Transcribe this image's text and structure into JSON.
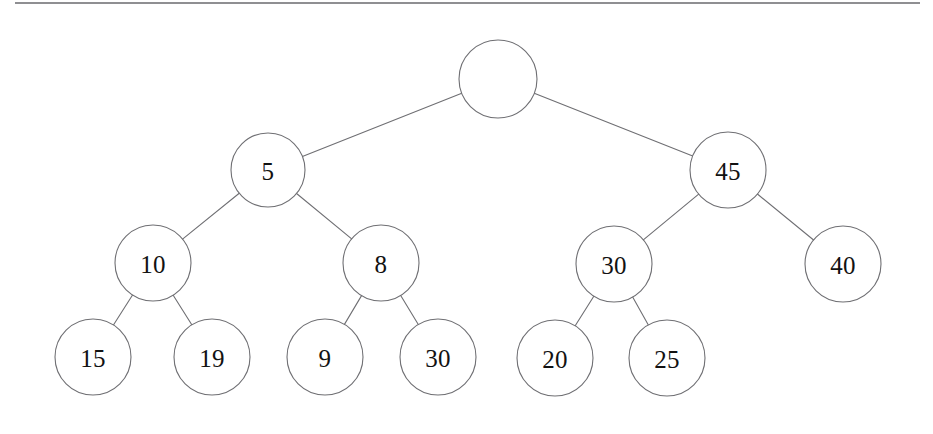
{
  "figure": {
    "canvas": {
      "width": 933,
      "height": 434
    },
    "background_color": "#ffffff",
    "stroke_color": "#6f6f73",
    "text_color": "#121212"
  },
  "top_rule": {
    "name": "top-border-rule",
    "x1": 15,
    "x2": 920,
    "y": 3,
    "color": "#6a6a6e"
  },
  "chart_data": {
    "type": "diagram",
    "subtype": "binary-tree",
    "node_radius": 38,
    "nodes": [
      {
        "id": "root",
        "label": "",
        "cx": 498,
        "cy": 79,
        "r": 39,
        "level": 0
      },
      {
        "id": "n5",
        "label": "5",
        "cx": 268,
        "cy": 170,
        "r": 37,
        "level": 1
      },
      {
        "id": "n45",
        "label": "45",
        "cx": 728,
        "cy": 170,
        "r": 38,
        "level": 1
      },
      {
        "id": "n10",
        "label": "10",
        "cx": 153,
        "cy": 263,
        "r": 38,
        "level": 2
      },
      {
        "id": "n8",
        "label": "8",
        "cx": 381,
        "cy": 263,
        "r": 38,
        "level": 2
      },
      {
        "id": "n30a",
        "label": "30",
        "cx": 614,
        "cy": 264,
        "r": 38,
        "level": 2
      },
      {
        "id": "n40",
        "label": "40",
        "cx": 843,
        "cy": 264,
        "r": 38,
        "level": 2
      },
      {
        "id": "n15",
        "label": "15",
        "cx": 93,
        "cy": 357,
        "r": 38,
        "level": 3
      },
      {
        "id": "n19",
        "label": "19",
        "cx": 212,
        "cy": 357,
        "r": 38,
        "level": 3
      },
      {
        "id": "n9",
        "label": "9",
        "cx": 325,
        "cy": 357,
        "r": 38,
        "level": 3
      },
      {
        "id": "n30b",
        "label": "30",
        "cx": 438,
        "cy": 357,
        "r": 38,
        "level": 3
      },
      {
        "id": "n20",
        "label": "20",
        "cx": 555,
        "cy": 358,
        "r": 38,
        "level": 3
      },
      {
        "id": "n25",
        "label": "25",
        "cx": 667,
        "cy": 358,
        "r": 38,
        "level": 3
      }
    ],
    "edges": [
      {
        "from": "root",
        "to": "n5",
        "side": "left"
      },
      {
        "from": "root",
        "to": "n45",
        "side": "right"
      },
      {
        "from": "n5",
        "to": "n10",
        "side": "left"
      },
      {
        "from": "n5",
        "to": "n8",
        "side": "right"
      },
      {
        "from": "n45",
        "to": "n30a",
        "side": "left"
      },
      {
        "from": "n45",
        "to": "n40",
        "side": "right"
      },
      {
        "from": "n10",
        "to": "n15",
        "side": "left"
      },
      {
        "from": "n10",
        "to": "n19",
        "side": "right"
      },
      {
        "from": "n8",
        "to": "n9",
        "side": "left"
      },
      {
        "from": "n8",
        "to": "n30b",
        "side": "right"
      },
      {
        "from": "n30a",
        "to": "n20",
        "side": "left"
      },
      {
        "from": "n30a",
        "to": "n25",
        "side": "right"
      }
    ],
    "level_order_labels": [
      "",
      "5",
      "45",
      "10",
      "8",
      "30",
      "40",
      "15",
      "19",
      "9",
      "30",
      "20",
      "25"
    ]
  }
}
